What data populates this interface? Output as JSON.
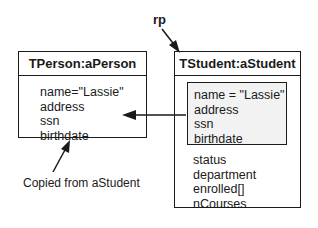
{
  "pointer_label": "rp",
  "person_object": {
    "title": "TPerson:aPerson",
    "fields": [
      "name=\"Lassie\"",
      "address",
      "ssn",
      "birthdate"
    ]
  },
  "student_object": {
    "title": "TStudent:aStudent",
    "inherited_fields": [
      "name = \"Lassie\"",
      "address",
      "ssn",
      "birthdate"
    ],
    "own_fields": [
      "status",
      "department",
      "enrolled[]",
      "nCourses"
    ]
  },
  "annotation": "Copied from aStudent"
}
